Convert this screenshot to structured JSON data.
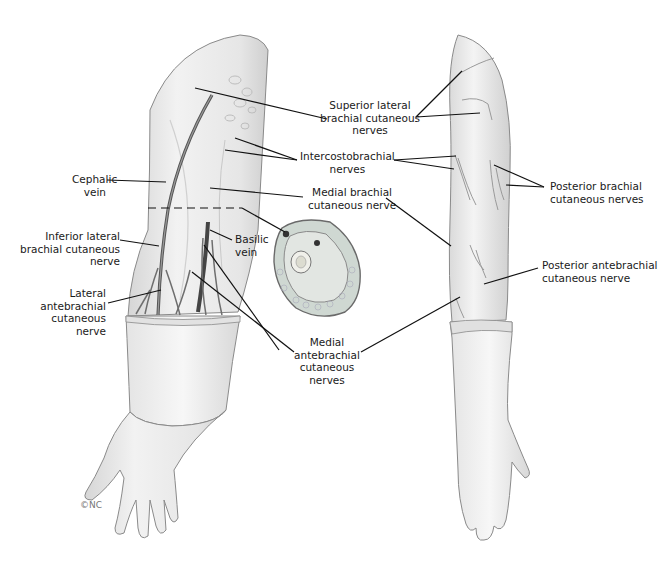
{
  "figure": {
    "signature": "©NC"
  },
  "labels": {
    "superior_lateral": "Superior lateral\nbrachial cutaneous\nnerves",
    "intercostobrachial": "Intercostobrachial\nnerves",
    "medial_brachial": "Medial brachial\ncutaneous nerve",
    "cephalic_vein": "Cephalic\nvein",
    "inferior_lateral": "Inferior lateral\nbrachial cutaneous\nnerve",
    "basilic_vein": "Basilic\nvein",
    "lateral_antebrachial": "Lateral\nantebrachial\ncutaneous\nnerve",
    "medial_antebrachial": "Medial\nantebrachial\ncutaneous\nnerves",
    "posterior_brachial": "Posterior brachial\ncutaneous nerves",
    "posterior_antebrachial": "Posterior antebrachial\ncutaneous nerve"
  },
  "colors": {
    "background": "#ffffff",
    "skin": "#ececec",
    "skin_shadow": "#cfcfcf",
    "outline": "#8a8a8a",
    "leader": "#111111",
    "nerve": "#6e6e6e"
  }
}
